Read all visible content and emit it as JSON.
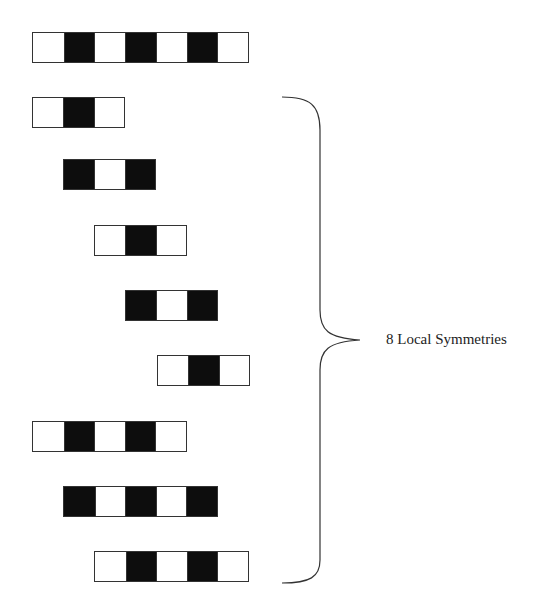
{
  "diagram": {
    "cell_width": 31,
    "colors": {
      "black": "#0d0d0d",
      "white": "#ffffff",
      "border": "#333333"
    },
    "full_pattern": {
      "x": 32,
      "y": 32,
      "cells": [
        "W",
        "B",
        "W",
        "B",
        "W",
        "B",
        "W"
      ]
    },
    "local_patterns": [
      {
        "x": 32,
        "y": 97,
        "cells": [
          "W",
          "B",
          "W"
        ]
      },
      {
        "x": 63,
        "y": 159,
        "cells": [
          "B",
          "W",
          "B"
        ]
      },
      {
        "x": 94,
        "y": 225,
        "cells": [
          "W",
          "B",
          "W"
        ]
      },
      {
        "x": 125,
        "y": 290,
        "cells": [
          "B",
          "W",
          "B"
        ]
      },
      {
        "x": 157,
        "y": 355,
        "cells": [
          "W",
          "B",
          "W"
        ]
      },
      {
        "x": 32,
        "y": 421,
        "cells": [
          "W",
          "B",
          "W",
          "B",
          "W"
        ]
      },
      {
        "x": 63,
        "y": 486,
        "cells": [
          "B",
          "W",
          "B",
          "W",
          "B"
        ]
      },
      {
        "x": 94,
        "y": 551,
        "cells": [
          "W",
          "B",
          "W",
          "B",
          "W"
        ]
      }
    ],
    "brace_label": "8 Local Symmetries"
  }
}
